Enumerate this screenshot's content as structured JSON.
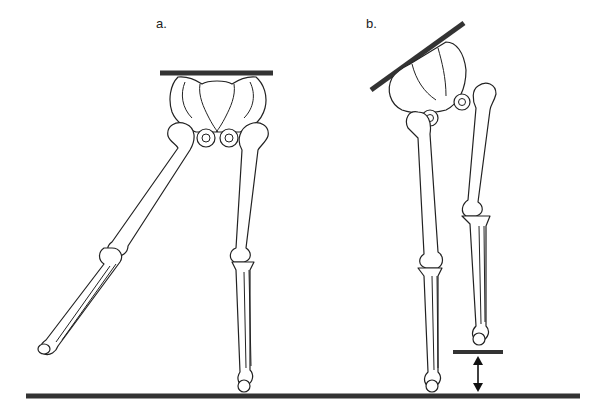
{
  "figure": {
    "panels": [
      {
        "id": "a",
        "label": "a.",
        "description": "Pelvis level, one leg abducted"
      },
      {
        "id": "b",
        "label": "b.",
        "description": "Pelvis tilted, one leg shortened with height gap"
      }
    ],
    "colors": {
      "bar": "#333333",
      "outline": "#222222",
      "background": "#ffffff"
    }
  }
}
